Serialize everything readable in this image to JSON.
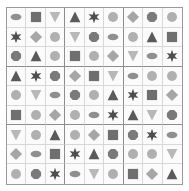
{
  "figure": {
    "kind": "shape-sudoku-grid",
    "rows": 9,
    "cols": 9,
    "block_rows": 3,
    "block_cols": 3,
    "background_color": "#ffffff",
    "cell_background_color": "#fbfbfb",
    "outer_border_color": "#9a9a9a",
    "cell_border_color": "#d8d8d8",
    "block_border_color": "#8d8d8d"
  },
  "shape_legend": [
    {
      "name": "ellipse",
      "label": "ellipse"
    },
    {
      "name": "square",
      "label": "square"
    },
    {
      "name": "triangle-down",
      "label": "triangle-down"
    },
    {
      "name": "triangle-up",
      "label": "triangle-up"
    },
    {
      "name": "star",
      "label": "six-pointed star"
    },
    {
      "name": "circle",
      "label": "circle"
    },
    {
      "name": "diamond",
      "label": "diamond"
    },
    {
      "name": "octagon",
      "label": "octagon"
    }
  ],
  "palette": {
    "ellipse": "#8f8f8f",
    "square": "#6f6f6f",
    "triangle-down": "#b8b8b8",
    "triangle-up": "#5a5a5a",
    "star": "#4e4e4e",
    "circle": "#b0b0b0",
    "diamond": "#a6a6a6",
    "octagon": "#7a7a7a"
  },
  "grid": [
    [
      "ellipse",
      "square",
      "triangle-down",
      "triangle-up",
      "star",
      "circle",
      "diamond",
      "octagon",
      "circle"
    ],
    [
      "star",
      "diamond",
      "circle",
      "triangle-down",
      "octagon",
      "ellipse",
      "circle",
      "triangle-up",
      "square"
    ],
    [
      "octagon",
      "triangle-up",
      "circle",
      "square",
      "circle",
      "diamond",
      "triangle-down",
      "ellipse",
      "star"
    ],
    [
      "triangle-up",
      "star",
      "octagon",
      "diamond",
      "square",
      "triangle-down",
      "ellipse",
      "circle",
      "circle"
    ],
    [
      "circle",
      "triangle-down",
      "ellipse",
      "octagon",
      "circle",
      "triangle-up",
      "star",
      "square",
      "diamond"
    ],
    [
      "square",
      "circle",
      "diamond",
      "circle",
      "ellipse",
      "star",
      "triangle-up",
      "triangle-down",
      "octagon"
    ],
    [
      "triangle-down",
      "circle",
      "triangle-up",
      "circle",
      "diamond",
      "square",
      "octagon",
      "star",
      "ellipse"
    ],
    [
      "diamond",
      "ellipse",
      "square",
      "star",
      "triangle-up",
      "octagon",
      "circle",
      "circle",
      "triangle-down"
    ],
    [
      "circle",
      "octagon",
      "star",
      "ellipse",
      "triangle-down",
      "circle",
      "square",
      "diamond",
      "triangle-up"
    ]
  ]
}
